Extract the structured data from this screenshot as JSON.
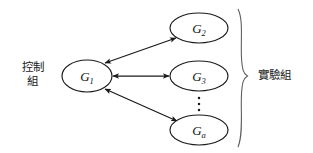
{
  "diagram": {
    "type": "node-link-diagram",
    "background_color": "#ffffff",
    "stroke_color": "#1a1a1a",
    "labels": {
      "control_group": "控制\n組",
      "experimental_group": "實驗組"
    },
    "nodes": [
      {
        "id": "G1",
        "base": "G",
        "subscript": "1",
        "subscript_italic": false,
        "cx": 87,
        "cy": 76,
        "rx": 25,
        "ry": 16
      },
      {
        "id": "G2",
        "base": "G",
        "subscript": "2",
        "subscript_italic": false,
        "cx": 199,
        "cy": 28,
        "rx": 29,
        "ry": 15
      },
      {
        "id": "G3",
        "base": "G",
        "subscript": "3",
        "subscript_italic": false,
        "cx": 199,
        "cy": 76,
        "rx": 29,
        "ry": 15
      },
      {
        "id": "Ga",
        "base": "G",
        "subscript": "a",
        "subscript_italic": true,
        "cx": 199,
        "cy": 130,
        "rx": 29,
        "ry": 15
      }
    ],
    "edges": [
      {
        "from": "G1",
        "to": "G2",
        "arrowheads": "both"
      },
      {
        "from": "G1",
        "to": "G3",
        "arrowheads": "both"
      },
      {
        "from": "G1",
        "to": "Ga",
        "arrowheads": "both"
      }
    ],
    "ellipsis": {
      "symbol": "vertical-ellipsis",
      "dots": 3,
      "x": 199,
      "y_top": 96,
      "y_bottom": 112
    },
    "brace": {
      "orientation": "right-facing",
      "x": 243,
      "y_top": 8,
      "y_bottom": 148,
      "color": "#5a5a5a"
    }
  }
}
